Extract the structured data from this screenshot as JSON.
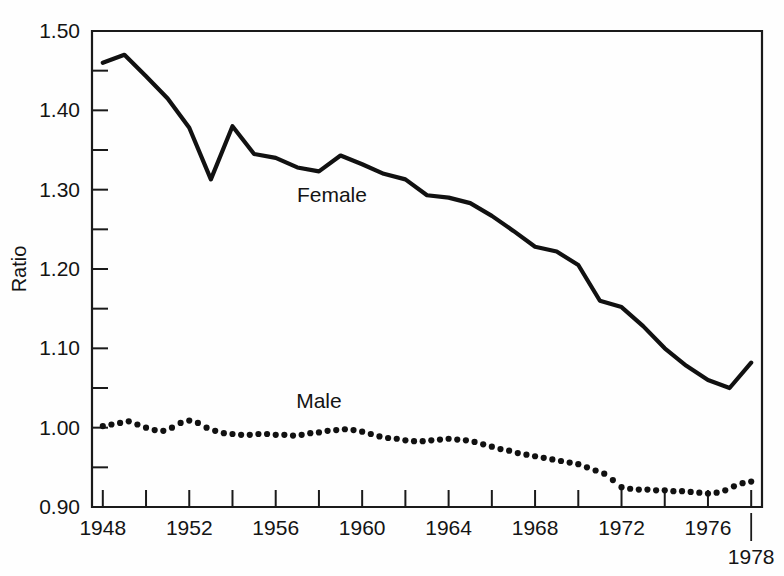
{
  "chart_data": {
    "type": "line",
    "title": "",
    "xlabel": "",
    "ylabel": "Ratio",
    "xlim": [
      1947.5,
      1978.5
    ],
    "ylim": [
      0.9,
      1.5
    ],
    "grid": false,
    "legend_position": "inline-annotation",
    "y_ticks_major": [
      "0.90",
      "1.00",
      "1.10",
      "1.20",
      "1.30",
      "1.40",
      "1.50"
    ],
    "y_ticks_major_values": [
      0.9,
      1.0,
      1.1,
      1.2,
      1.3,
      1.4,
      1.5
    ],
    "y_ticks_minor_values": [
      0.95,
      1.05,
      1.15,
      1.25,
      1.35,
      1.45
    ],
    "x_ticks_values": [
      1948,
      1950,
      1952,
      1954,
      1956,
      1958,
      1960,
      1962,
      1964,
      1966,
      1968,
      1970,
      1972,
      1974,
      1976,
      1978
    ],
    "x_tick_labels": [
      "1948",
      "",
      "1952",
      "",
      "1956",
      "",
      "1960",
      "",
      "1964",
      "",
      "1968",
      "",
      "1972",
      "",
      "1976",
      ""
    ],
    "x_outer_label": "1978",
    "annotations": [
      {
        "text": "Female",
        "x": 1958.6,
        "y": 1.285
      },
      {
        "text": "Male",
        "x": 1958.0,
        "y": 1.025
      }
    ],
    "series": [
      {
        "name": "Female",
        "style": "solid-line",
        "x": [
          1948,
          1949,
          1950,
          1951,
          1952,
          1953,
          1954,
          1955,
          1956,
          1957,
          1958,
          1959,
          1960,
          1961,
          1962,
          1963,
          1964,
          1965,
          1966,
          1967,
          1968,
          1969,
          1970,
          1971,
          1972,
          1973,
          1974,
          1975,
          1976,
          1977,
          1978
        ],
        "values": [
          1.46,
          1.47,
          1.443,
          1.415,
          1.378,
          1.313,
          1.38,
          1.345,
          1.34,
          1.328,
          1.323,
          1.343,
          1.332,
          1.32,
          1.313,
          1.293,
          1.29,
          1.283,
          1.267,
          1.248,
          1.228,
          1.222,
          1.205,
          1.16,
          1.152,
          1.128,
          1.1,
          1.078,
          1.06,
          1.05,
          1.082
        ]
      },
      {
        "name": "Male",
        "style": "dotted",
        "x": [
          1948.0,
          1948.4,
          1948.8,
          1949.2,
          1949.6,
          1950.0,
          1950.4,
          1950.8,
          1951.2,
          1951.6,
          1952.0,
          1952.4,
          1952.8,
          1953.2,
          1953.6,
          1954.0,
          1954.4,
          1954.8,
          1955.2,
          1955.6,
          1956.0,
          1956.4,
          1956.8,
          1957.2,
          1957.6,
          1958.0,
          1958.4,
          1958.8,
          1959.2,
          1959.6,
          1960.0,
          1960.4,
          1960.8,
          1961.2,
          1961.6,
          1962.0,
          1962.4,
          1962.8,
          1963.2,
          1963.6,
          1964.0,
          1964.4,
          1964.8,
          1965.2,
          1965.6,
          1966.0,
          1966.4,
          1966.8,
          1967.2,
          1967.6,
          1968.0,
          1968.4,
          1968.8,
          1969.2,
          1969.6,
          1970.0,
          1970.4,
          1970.8,
          1971.2,
          1971.6,
          1972.0,
          1972.4,
          1972.8,
          1973.2,
          1973.6,
          1974.0,
          1974.4,
          1974.8,
          1975.2,
          1975.6,
          1976.0,
          1976.4,
          1976.8,
          1977.2,
          1977.6,
          1978.0
        ],
        "values": [
          1.002,
          1.004,
          1.006,
          1.008,
          1.004,
          1.0,
          0.997,
          0.996,
          1.0,
          1.006,
          1.009,
          1.006,
          1.0,
          0.996,
          0.993,
          0.992,
          0.991,
          0.991,
          0.992,
          0.992,
          0.991,
          0.991,
          0.99,
          0.991,
          0.993,
          0.994,
          0.996,
          0.997,
          0.998,
          0.997,
          0.995,
          0.992,
          0.989,
          0.987,
          0.986,
          0.984,
          0.983,
          0.983,
          0.984,
          0.985,
          0.986,
          0.985,
          0.984,
          0.982,
          0.979,
          0.976,
          0.973,
          0.971,
          0.968,
          0.966,
          0.964,
          0.962,
          0.96,
          0.958,
          0.956,
          0.954,
          0.95,
          0.946,
          0.942,
          0.934,
          0.925,
          0.923,
          0.922,
          0.922,
          0.921,
          0.921,
          0.92,
          0.92,
          0.919,
          0.918,
          0.917,
          0.918,
          0.921,
          0.926,
          0.93,
          0.932
        ]
      }
    ]
  },
  "axis": {
    "y_title": "Ratio"
  }
}
